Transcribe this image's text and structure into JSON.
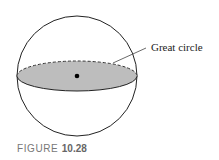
{
  "figure": {
    "label": "Great circle",
    "caption_prefix": "FIGURE",
    "caption_number": "10.28"
  },
  "colors": {
    "outline": "#222222",
    "fill": "#bdbdbd",
    "caption": "#777777"
  }
}
